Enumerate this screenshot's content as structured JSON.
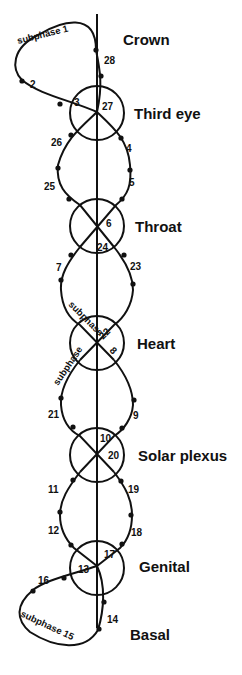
{
  "diagram": {
    "chakras": [
      {
        "id": "crown",
        "label": "Crown"
      },
      {
        "id": "third-eye",
        "label": "Third eye"
      },
      {
        "id": "throat",
        "label": "Throat"
      },
      {
        "id": "heart",
        "label": "Heart"
      },
      {
        "id": "solar-plexus",
        "label": "Solar plexus"
      },
      {
        "id": "genital",
        "label": "Genital"
      },
      {
        "id": "basal",
        "label": "Basal"
      }
    ],
    "subphase_labels": {
      "top": "subphase 1",
      "heart_upper": "subphase",
      "heart_lower": "subphase",
      "bottom": "subphase 15",
      "heart_upper_num": "22",
      "heart_lower_num": "8"
    },
    "phase_numbers": {
      "n2": "2",
      "n3": "3",
      "n4": "4",
      "n5": "5",
      "n6": "6",
      "n7": "7",
      "n9": "9",
      "n10": "10",
      "n11": "11",
      "n12": "12",
      "n13": "13",
      "n14": "14",
      "n16": "16",
      "n17": "17",
      "n18": "18",
      "n19": "19",
      "n20": "20",
      "n21": "21",
      "n23": "23",
      "n24": "24",
      "n25": "25",
      "n26": "26",
      "n27": "27",
      "n28": "28"
    }
  }
}
